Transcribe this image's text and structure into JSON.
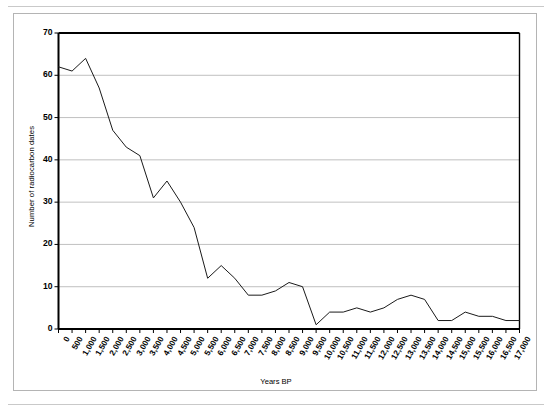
{
  "figure": {
    "frame_border_color": "#b4b4b4",
    "background": "#ffffff"
  },
  "chart_data": {
    "type": "line",
    "title": "",
    "subtitle": "",
    "xlabel": "Years BP",
    "ylabel": "Number of radiocarbon dates",
    "xlim": [
      0,
      17000
    ],
    "ylim": [
      0,
      70
    ],
    "grid": true,
    "grid_axis": "y",
    "legend": false,
    "legend_position": "none",
    "line_color": "#1a1a1a",
    "line_width": 1,
    "axis_color": "#000000",
    "gridline_color": "#b0b0b0",
    "y_ticks": [
      0,
      10,
      20,
      30,
      40,
      50,
      60,
      70
    ],
    "y_tick_labels": [
      "0",
      "10",
      "20",
      "30",
      "40",
      "50",
      "60",
      "70"
    ],
    "categories": [
      "0",
      "500",
      "1,000",
      "1,500",
      "2,000",
      "2,500",
      "3,000",
      "3,500",
      "4,000",
      "4,500",
      "5,000",
      "5,500",
      "6,000",
      "6,500",
      "7,000",
      "7,500",
      "8,000",
      "8,500",
      "9,000",
      "9,500",
      "10,000",
      "10,500",
      "11,000",
      "11,500",
      "12,000",
      "12,500",
      "13,000",
      "13,500",
      "14,000",
      "14,500",
      "15,000",
      "15,500",
      "16,000",
      "16,500",
      "17,000"
    ],
    "x": [
      0,
      500,
      1000,
      1500,
      2000,
      2500,
      3000,
      3500,
      4000,
      4500,
      5000,
      5500,
      6000,
      6500,
      7000,
      7500,
      8000,
      8500,
      9000,
      9500,
      10000,
      10500,
      11000,
      11500,
      12000,
      12500,
      13000,
      13500,
      14000,
      14500,
      15000,
      15500,
      16000,
      16500,
      17000
    ],
    "values": [
      62,
      61,
      64,
      57,
      47,
      43,
      41,
      31,
      35,
      30,
      24,
      12,
      15,
      12,
      8,
      8,
      9,
      11,
      10,
      1,
      4,
      4,
      5,
      4,
      5,
      7,
      8,
      7,
      2,
      2,
      4,
      3,
      3,
      2,
      2
    ],
    "series": [
      {
        "name": "Number of radiocarbon dates",
        "values": [
          62,
          61,
          64,
          57,
          47,
          43,
          41,
          31,
          35,
          30,
          24,
          12,
          15,
          12,
          8,
          8,
          9,
          11,
          10,
          1,
          4,
          4,
          5,
          4,
          5,
          7,
          8,
          7,
          2,
          2,
          4,
          3,
          3,
          2,
          2
        ]
      }
    ]
  }
}
